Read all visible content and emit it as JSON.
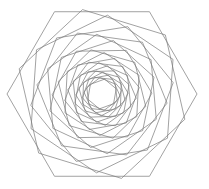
{
  "figure": {
    "shape_name": "hexagon",
    "sides": 6,
    "background_color": "#ffffff",
    "stroke_color": "#7a7a7a",
    "stroke_width": 0.7,
    "fill": "none"
  },
  "canvas": {
    "width": 209,
    "height": 189
  },
  "geometry": {
    "center_x": 102,
    "center_y": 94,
    "outer_circumradius": 95,
    "innermost_circumradius": 14.5,
    "rotation_step_degrees": 17,
    "scale_step": 0.912,
    "initial_rotation_degrees": 0,
    "orientation": "flat-top",
    "ring_count": 9
  },
  "chart_data": {
    "type": "scatter",
    "xlabel": "",
    "ylabel": "",
    "grid": false,
    "legend": false,
    "rings": [
      {
        "index": 0,
        "circumradius": 95.0,
        "rotation_deg": 0,
        "stroke": "#7a7a7a"
      },
      {
        "index": 1,
        "circumradius": 86.6,
        "rotation_deg": 17,
        "stroke": "#7a7a7a"
      },
      {
        "index": 2,
        "circumradius": 79.0,
        "rotation_deg": 34,
        "stroke": "#7a7a7a"
      },
      {
        "index": 3,
        "circumradius": 72.1,
        "rotation_deg": 51,
        "stroke": "#7a7a7a"
      },
      {
        "index": 4,
        "circumradius": 65.7,
        "rotation_deg": 68,
        "stroke": "#7a7a7a"
      },
      {
        "index": 5,
        "circumradius": 59.9,
        "rotation_deg": 85,
        "stroke": "#7a7a7a"
      },
      {
        "index": 6,
        "circumradius": 54.7,
        "rotation_deg": 102,
        "stroke": "#7a7a7a"
      },
      {
        "index": 7,
        "circumradius": 49.9,
        "rotation_deg": 119,
        "stroke": "#7a7a7a"
      },
      {
        "index": 8,
        "circumradius": 45.5,
        "rotation_deg": 136,
        "stroke": "#7a7a7a"
      },
      {
        "index": 9,
        "circumradius": 41.5,
        "rotation_deg": 153,
        "stroke": "#7a7a7a"
      },
      {
        "index": 10,
        "circumradius": 37.8,
        "rotation_deg": 170,
        "stroke": "#7a7a7a"
      },
      {
        "index": 11,
        "circumradius": 34.5,
        "rotation_deg": 187,
        "stroke": "#7a7a7a"
      },
      {
        "index": 12,
        "circumradius": 31.5,
        "rotation_deg": 204,
        "stroke": "#7a7a7a"
      },
      {
        "index": 13,
        "circumradius": 28.7,
        "rotation_deg": 221,
        "stroke": "#7a7a7a"
      },
      {
        "index": 14,
        "circumradius": 26.2,
        "rotation_deg": 238,
        "stroke": "#7a7a7a"
      },
      {
        "index": 15,
        "circumradius": 23.9,
        "rotation_deg": 255,
        "stroke": "#7a7a7a"
      },
      {
        "index": 16,
        "circumradius": 21.8,
        "rotation_deg": 272,
        "stroke": "#7a7a7a"
      },
      {
        "index": 17,
        "circumradius": 19.9,
        "rotation_deg": 289,
        "stroke": "#7a7a7a"
      },
      {
        "index": 18,
        "circumradius": 18.1,
        "rotation_deg": 306,
        "stroke": "#7a7a7a"
      },
      {
        "index": 19,
        "circumradius": 16.5,
        "rotation_deg": 323,
        "stroke": "#7a7a7a"
      },
      {
        "index": 20,
        "circumradius": 15.1,
        "rotation_deg": 340,
        "stroke": "#7a7a7a"
      }
    ]
  }
}
